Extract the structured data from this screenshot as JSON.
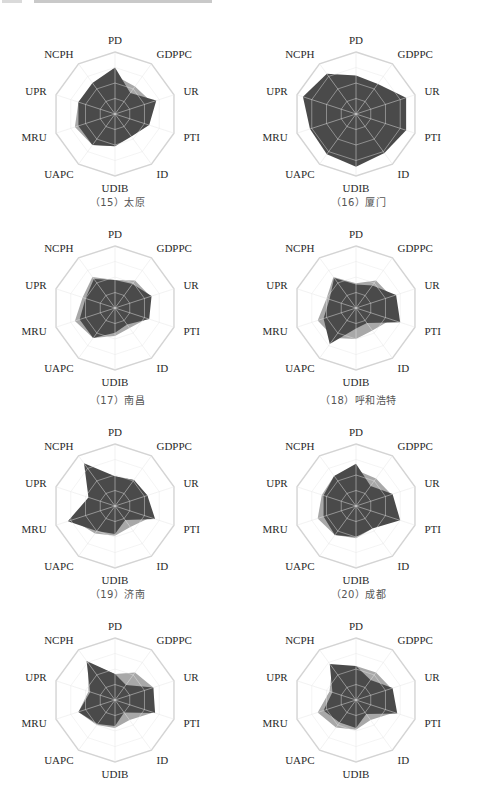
{
  "page": {
    "header_fragment": "cropped header text (illegible)"
  },
  "axes": [
    "PD",
    "GDPPC",
    "UR",
    "PTI",
    "ID",
    "UDIB",
    "UAPC",
    "MRU",
    "UPR",
    "NCPH"
  ],
  "colors": {
    "city_fill": "#4a4a4a",
    "reference_fill": "#a8a8a8",
    "grid": "#d4d4d4",
    "spoke": "#e6e6e6",
    "label": "#2a2a2a",
    "caption": "#555555"
  },
  "captions": [
    "",
    "",
    "（15）太原",
    "（16）厦门",
    "（17）南昌",
    "（18）呼和浩特",
    "（19）济南",
    "（20）成都"
  ],
  "chart_data": [
    {
      "type": "radar",
      "title": "",
      "axes": [
        "PD",
        "GDPPC",
        "UR",
        "PTI",
        "ID",
        "UDIB",
        "UAPC",
        "MRU",
        "UPR",
        "NCPH"
      ],
      "rings": 4,
      "ylim": [
        0,
        1
      ],
      "series": [
        {
          "name": "reference",
          "values": [
            0.62,
            0.55,
            0.62,
            0.55,
            0.4,
            0.52,
            0.62,
            0.68,
            0.62,
            0.58
          ]
        },
        {
          "name": "city",
          "values": [
            0.75,
            0.42,
            0.7,
            0.58,
            0.45,
            0.52,
            0.62,
            0.62,
            0.62,
            0.62
          ]
        }
      ]
    },
    {
      "type": "radar",
      "title": "",
      "axes": [
        "PD",
        "GDPPC",
        "UR",
        "PTI",
        "ID",
        "UDIB",
        "UAPC",
        "MRU",
        "UPR",
        "NCPH"
      ],
      "rings": 4,
      "ylim": [
        0,
        1
      ],
      "series": [
        {
          "name": "reference",
          "values": [
            0.6,
            0.55,
            0.6,
            0.55,
            0.5,
            0.55,
            0.6,
            0.6,
            0.6,
            0.6
          ]
        },
        {
          "name": "city",
          "values": [
            0.62,
            0.6,
            0.85,
            0.85,
            0.78,
            0.85,
            0.8,
            0.78,
            0.9,
            0.8
          ]
        }
      ]
    },
    {
      "type": "radar",
      "title": "",
      "axes": [
        "PD",
        "GDPPC",
        "UR",
        "PTI",
        "ID",
        "UDIB",
        "UAPC",
        "MRU",
        "UPR",
        "NCPH"
      ],
      "rings": 4,
      "ylim": [
        0,
        1
      ],
      "series": [
        {
          "name": "reference",
          "values": [
            0.45,
            0.55,
            0.6,
            0.55,
            0.4,
            0.45,
            0.6,
            0.68,
            0.55,
            0.62
          ]
        },
        {
          "name": "city",
          "values": [
            0.45,
            0.48,
            0.62,
            0.58,
            0.33,
            0.4,
            0.6,
            0.6,
            0.5,
            0.58
          ]
        }
      ]
    },
    {
      "type": "radar",
      "title": "",
      "axes": [
        "PD",
        "GDPPC",
        "UR",
        "PTI",
        "ID",
        "UDIB",
        "UAPC",
        "MRU",
        "UPR",
        "NCPH"
      ],
      "rings": 4,
      "ylim": [
        0,
        1
      ],
      "series": [
        {
          "name": "reference",
          "values": [
            0.4,
            0.55,
            0.6,
            0.6,
            0.45,
            0.5,
            0.6,
            0.65,
            0.5,
            0.62
          ]
        },
        {
          "name": "city",
          "values": [
            0.38,
            0.45,
            0.68,
            0.75,
            0.3,
            0.33,
            0.72,
            0.55,
            0.45,
            0.6
          ]
        }
      ]
    },
    {
      "type": "radar",
      "title": "",
      "axes": [
        "PD",
        "GDPPC",
        "UR",
        "PTI",
        "ID",
        "UDIB",
        "UAPC",
        "MRU",
        "UPR",
        "NCPH"
      ],
      "rings": 4,
      "ylim": [
        0,
        1
      ],
      "series": [
        {
          "name": "reference",
          "values": [
            0.48,
            0.52,
            0.55,
            0.6,
            0.42,
            0.48,
            0.55,
            0.72,
            0.45,
            0.78
          ]
        },
        {
          "name": "city",
          "values": [
            0.48,
            0.52,
            0.55,
            0.68,
            0.28,
            0.45,
            0.5,
            0.8,
            0.45,
            0.85
          ]
        }
      ]
    },
    {
      "type": "radar",
      "title": "",
      "axes": [
        "PD",
        "GDPPC",
        "UR",
        "PTI",
        "ID",
        "UDIB",
        "UAPC",
        "MRU",
        "UPR",
        "NCPH"
      ],
      "rings": 4,
      "ylim": [
        0,
        1
      ],
      "series": [
        {
          "name": "reference",
          "values": [
            0.58,
            0.55,
            0.6,
            0.58,
            0.45,
            0.52,
            0.58,
            0.65,
            0.58,
            0.6
          ]
        },
        {
          "name": "city",
          "values": [
            0.68,
            0.4,
            0.62,
            0.75,
            0.45,
            0.5,
            0.58,
            0.55,
            0.55,
            0.6
          ]
        }
      ]
    },
    {
      "type": "radar",
      "title": "",
      "axes": [
        "PD",
        "GDPPC",
        "UR",
        "PTI",
        "ID",
        "UDIB",
        "UAPC",
        "MRU",
        "UPR",
        "NCPH"
      ],
      "rings": 4,
      "ylim": [
        0,
        1
      ],
      "series": [
        {
          "name": "reference",
          "values": [
            0.42,
            0.55,
            0.65,
            0.65,
            0.4,
            0.45,
            0.5,
            0.62,
            0.45,
            0.75
          ]
        },
        {
          "name": "city",
          "values": [
            0.42,
            0.3,
            0.65,
            0.68,
            0.25,
            0.42,
            0.48,
            0.62,
            0.42,
            0.78
          ]
        }
      ]
    },
    {
      "type": "radar",
      "title": "",
      "axes": [
        "PD",
        "GDPPC",
        "UR",
        "PTI",
        "ID",
        "UDIB",
        "UAPC",
        "MRU",
        "UPR",
        "NCPH"
      ],
      "rings": 4,
      "ylim": [
        0,
        1
      ],
      "series": [
        {
          "name": "reference",
          "values": [
            0.55,
            0.55,
            0.6,
            0.65,
            0.4,
            0.48,
            0.55,
            0.65,
            0.45,
            0.65
          ]
        },
        {
          "name": "city",
          "values": [
            0.55,
            0.4,
            0.62,
            0.7,
            0.28,
            0.45,
            0.45,
            0.55,
            0.4,
            0.72
          ]
        }
      ]
    }
  ]
}
